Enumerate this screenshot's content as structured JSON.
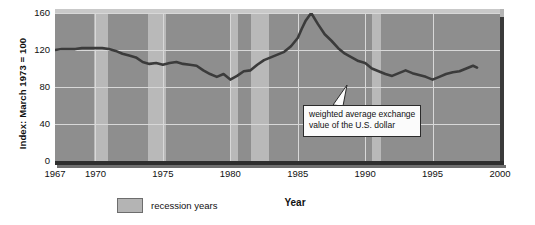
{
  "chart_data": {
    "type": "line",
    "title": "",
    "xlabel": "Year",
    "ylabel": "Index: March 1973 = 100",
    "xlim": [
      1967,
      2000
    ],
    "ylim": [
      0,
      160
    ],
    "grid": true,
    "xticks": [
      1967,
      1970,
      1975,
      1980,
      1985,
      1990,
      1995,
      2000
    ],
    "xtick_labels": [
      "1967",
      "1970",
      "1975",
      "1980",
      "1985",
      "1990",
      "1995",
      "2000"
    ],
    "yticks": [
      0,
      40,
      80,
      120,
      160
    ],
    "ytick_labels": [
      "0",
      "40",
      "80",
      "120",
      "160"
    ],
    "legend": {
      "position": "below-axis-left",
      "entries": [
        {
          "label": "recession years",
          "swatch_color": "#b4b4b4"
        }
      ]
    },
    "annotations": [
      {
        "text": "weighted average exchange value of the U.S. dollar",
        "line1": "weighted average exchange",
        "line2": "value of the U.S. dollar",
        "points_to_x": 1990.6,
        "points_to_y": 93
      }
    ],
    "shaded_regions": [
      {
        "label": "recession years",
        "start": 1969.9,
        "end": 1970.9
      },
      {
        "label": "recession years",
        "start": 1973.9,
        "end": 1975.2
      },
      {
        "label": "recession years",
        "start": 1980.0,
        "end": 1980.6
      },
      {
        "label": "recession years",
        "start": 1981.5,
        "end": 1982.9
      },
      {
        "label": "recession years",
        "start": 1990.5,
        "end": 1991.2
      }
    ],
    "series": [
      {
        "name": "weighted average exchange value of the U.S. dollar",
        "color": "#3b3b3b",
        "x": [
          1967.0,
          1967.5,
          1968.0,
          1968.5,
          1969.0,
          1969.5,
          1970.0,
          1970.5,
          1971.0,
          1971.5,
          1972.0,
          1972.5,
          1973.0,
          1973.5,
          1974.0,
          1974.5,
          1975.0,
          1975.5,
          1976.0,
          1976.5,
          1977.0,
          1977.5,
          1978.0,
          1978.5,
          1979.0,
          1979.5,
          1980.0,
          1980.5,
          1981.0,
          1981.5,
          1982.0,
          1982.5,
          1983.0,
          1983.5,
          1984.0,
          1984.5,
          1985.0,
          1985.3,
          1985.6,
          1986.0,
          1986.5,
          1987.0,
          1987.5,
          1988.0,
          1988.5,
          1989.0,
          1989.5,
          1990.0,
          1990.5,
          1991.0,
          1991.5,
          1992.0,
          1992.5,
          1993.0,
          1993.5,
          1994.0,
          1994.5,
          1995.0,
          1995.5,
          1996.0,
          1996.5,
          1997.0,
          1997.5,
          1998.0,
          1998.3
        ],
        "y": [
          120,
          121,
          121,
          121,
          122,
          122,
          122,
          122,
          121,
          119,
          116,
          114,
          112,
          107,
          105,
          106,
          104,
          106,
          107,
          105,
          104,
          103,
          98,
          94,
          91,
          94,
          88,
          92,
          97,
          98,
          104,
          109,
          112,
          115,
          118,
          124,
          133,
          143,
          152,
          160,
          148,
          137,
          130,
          122,
          116,
          112,
          108,
          106,
          100,
          97,
          94,
          92,
          95,
          98,
          95,
          93,
          91,
          88,
          91,
          94,
          96,
          97,
          100,
          103,
          101
        ]
      }
    ]
  }
}
